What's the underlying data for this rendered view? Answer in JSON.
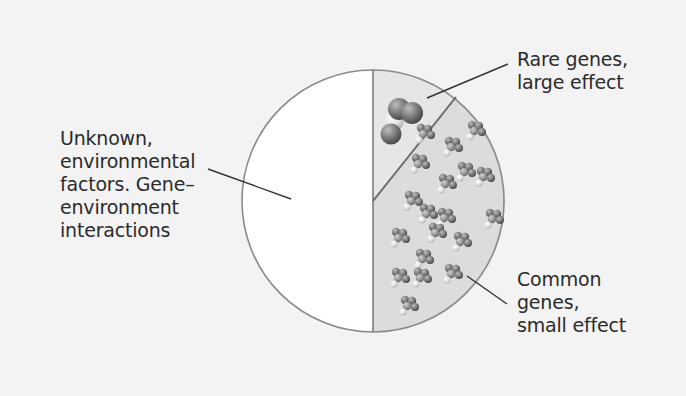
{
  "diagram": {
    "type": "pie-illustration",
    "segments": [
      {
        "id": "unknown",
        "label_lines": [
          "Unknown,",
          "environmental",
          "factors. Gene–",
          "environment",
          "interactions"
        ],
        "fraction": 0.5,
        "fill": "#ffffff"
      },
      {
        "id": "rare",
        "label_lines": [
          "Rare genes,",
          "large effect"
        ],
        "fraction": 0.11,
        "fill": "#e6e6e6"
      },
      {
        "id": "common",
        "label_lines": [
          "Common",
          "genes,",
          "small effect"
        ],
        "fraction": 0.39,
        "fill": "#dcdcdc"
      }
    ],
    "colors": {
      "background": "#f3f3f3",
      "outline": "#7a7a7a",
      "leader_line": "#333333",
      "text": "#2b2b2b"
    },
    "icons": {
      "rare": "large-molecule-icon",
      "common": "small-molecule-cluster-icon"
    }
  }
}
